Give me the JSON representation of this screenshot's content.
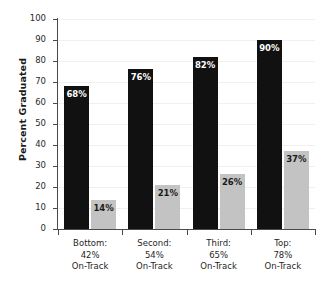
{
  "chart_data": {
    "type": "bar",
    "title": "",
    "xlabel": "",
    "ylabel": "Percent Graduated",
    "ylim": [
      0,
      100
    ],
    "ytick_labels": [
      "0",
      "10",
      "20",
      "30",
      "40",
      "50",
      "60",
      "70",
      "80",
      "90",
      "100"
    ],
    "ytick_values": [
      0,
      10,
      20,
      30,
      40,
      50,
      60,
      70,
      80,
      90,
      100
    ],
    "grid": true,
    "legend_position": "none",
    "categories": [
      {
        "line1": "Bottom:",
        "line2": "42%",
        "line3": "On-Track"
      },
      {
        "line1": "Second:",
        "line2": "54%",
        "line3": "On-Track"
      },
      {
        "line1": "Third:",
        "line2": "65%",
        "line3": "On-Track"
      },
      {
        "line1": "Top:",
        "line2": "78%",
        "line3": "On-Track"
      }
    ],
    "series": [
      {
        "name": "dark",
        "color": "#111111",
        "values": [
          68,
          76,
          82,
          90
        ],
        "labels": [
          "68%",
          "76%",
          "82%",
          "90%"
        ]
      },
      {
        "name": "light",
        "color": "#c3c3c3",
        "values": [
          14,
          21,
          26,
          37
        ],
        "labels": [
          "14%",
          "21%",
          "26%",
          "37%"
        ]
      }
    ]
  }
}
